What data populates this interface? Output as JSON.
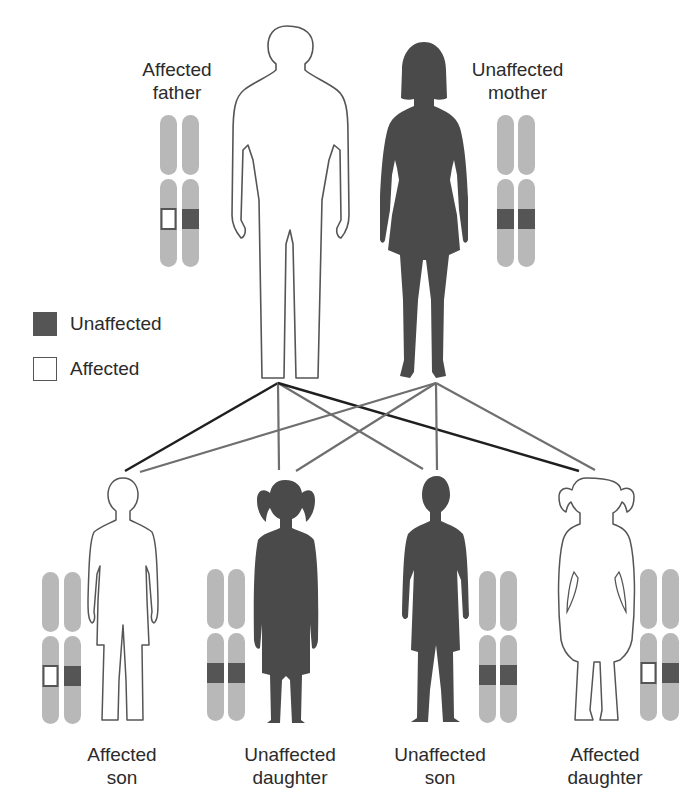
{
  "diagram": {
    "type": "pedigree-inheritance",
    "colors": {
      "unaffected_allele": "#555555",
      "affected_allele": "#ffffff",
      "chromosome": "#b8b8b8",
      "silhouette_dark": "#4a4a4a",
      "outline": "#555555",
      "line_dark": "#1f1f1f",
      "line_gray": "#6f6f6f"
    },
    "parents": [
      {
        "id": "father",
        "label_line1": "Affected",
        "label_line2": "father",
        "status": "affected",
        "alleles": [
          "affected",
          "unaffected"
        ]
      },
      {
        "id": "mother",
        "label_line1": "Unaffected",
        "label_line2": "mother",
        "status": "unaffected",
        "alleles": [
          "unaffected",
          "unaffected"
        ]
      }
    ],
    "legend": [
      {
        "label": "Unaffected",
        "swatch": "dark"
      },
      {
        "label": "Affected",
        "swatch": "white"
      }
    ],
    "children": [
      {
        "id": "son-1",
        "label_line1": "Affected",
        "label_line2": "son",
        "status": "affected",
        "alleles": [
          "affected",
          "unaffected"
        ]
      },
      {
        "id": "daughter-1",
        "label_line1": "Unaffected",
        "label_line2": "daughter",
        "status": "unaffected",
        "alleles": [
          "unaffected",
          "unaffected"
        ]
      },
      {
        "id": "son-2",
        "label_line1": "Unaffected",
        "label_line2": "son",
        "status": "unaffected",
        "alleles": [
          "unaffected",
          "unaffected"
        ]
      },
      {
        "id": "daughter-2",
        "label_line1": "Affected",
        "label_line2": "daughter",
        "status": "affected",
        "alleles": [
          "affected",
          "unaffected"
        ]
      }
    ]
  }
}
